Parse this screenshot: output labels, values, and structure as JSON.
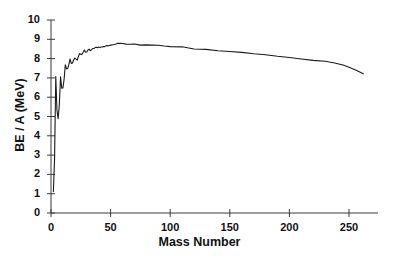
{
  "chart_data": {
    "type": "line",
    "title": "",
    "xlabel": "Mass Number",
    "ylabel": "BE / A (MeV)",
    "xlim": [
      0,
      270
    ],
    "ylim": [
      0,
      10
    ],
    "xticks": [
      0,
      50,
      100,
      150,
      200,
      250
    ],
    "xtick_labels": [
      "0",
      "50",
      "100",
      "150",
      "200",
      "250"
    ],
    "yticks": [
      0,
      1,
      2,
      3,
      4,
      5,
      6,
      7,
      8,
      9,
      10
    ],
    "ytick_labels": [
      "0",
      "1",
      "2",
      "3",
      "4",
      "5",
      "6",
      "7",
      "8",
      "9",
      "10"
    ],
    "grid": false,
    "legend": false,
    "line_color": "#1a1a1a",
    "line_width": 1.1,
    "series": [
      {
        "name": "Binding energy per nucleon",
        "x": [
          2,
          3,
          4,
          5,
          6,
          7,
          8,
          9,
          10,
          11,
          12,
          13,
          14,
          15,
          16,
          17,
          18,
          19,
          20,
          21,
          22,
          23,
          24,
          25,
          26,
          27,
          28,
          29,
          30,
          31,
          32,
          33,
          34,
          35,
          36,
          37,
          38,
          39,
          40,
          41,
          42,
          43,
          44,
          45,
          46,
          48,
          50,
          52,
          54,
          56,
          58,
          60,
          63,
          66,
          70,
          75,
          80,
          85,
          90,
          95,
          100,
          110,
          120,
          130,
          140,
          150,
          160,
          170,
          180,
          190,
          200,
          210,
          220,
          230,
          238,
          245,
          250,
          256,
          262
        ],
        "y": [
          1.11,
          2.83,
          7.07,
          5.33,
          4.88,
          5.61,
          7.06,
          6.46,
          6.48,
          6.93,
          7.68,
          7.47,
          7.48,
          7.7,
          7.98,
          7.75,
          7.77,
          7.93,
          8.03,
          7.97,
          7.92,
          8.11,
          8.26,
          8.22,
          8.22,
          8.33,
          8.45,
          8.33,
          8.34,
          8.45,
          8.49,
          8.41,
          8.46,
          8.52,
          8.52,
          8.57,
          8.59,
          8.56,
          8.6,
          8.58,
          8.6,
          8.6,
          8.62,
          8.62,
          8.66,
          8.67,
          8.7,
          8.72,
          8.74,
          8.79,
          8.79,
          8.78,
          8.75,
          8.74,
          8.76,
          8.7,
          8.71,
          8.7,
          8.69,
          8.65,
          8.62,
          8.61,
          8.5,
          8.48,
          8.41,
          8.37,
          8.32,
          8.25,
          8.2,
          8.12,
          8.06,
          7.98,
          7.91,
          7.86,
          7.77,
          7.67,
          7.55,
          7.4,
          7.21
        ]
      }
    ]
  },
  "axis": {
    "x_title": "Mass Number",
    "y_title": "BE / A (MeV)"
  }
}
